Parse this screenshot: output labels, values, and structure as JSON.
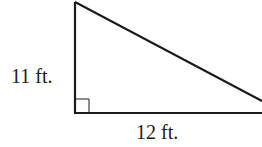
{
  "diagram": {
    "type": "right-triangle",
    "height_label": "11 ft.",
    "base_label": "12 ft.",
    "stroke_color": "#1a1a1a",
    "right_angle_marker": true
  }
}
